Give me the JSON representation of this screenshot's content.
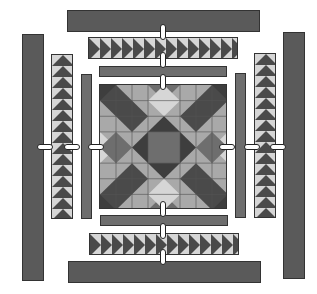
{
  "diagram": {
    "type": "quilt-assembly",
    "center_block": "star medallion",
    "borders": [
      {
        "name": "inner-border",
        "pieces": 4
      },
      {
        "name": "flying-geese-border",
        "pieces": 4
      },
      {
        "name": "outer-border",
        "pieces": 4
      }
    ],
    "colors": {
      "dark": "#3e3e3e",
      "medium": "#6e6e6e",
      "light": "#a9a9a9",
      "pale": "#d6d6d6"
    }
  }
}
